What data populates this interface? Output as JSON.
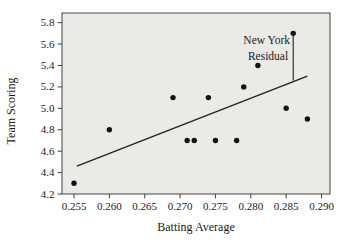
{
  "figure": {
    "background": "#ffffff"
  },
  "chart_data": {
    "type": "scatter",
    "title": "",
    "xlabel": "Batting Average",
    "ylabel": "Team Scoring",
    "xlim": [
      0.2533,
      0.2912
    ],
    "ylim": [
      4.2,
      5.89
    ],
    "xticks": [
      0.255,
      0.26,
      0.265,
      0.27,
      0.275,
      0.28,
      0.285,
      0.29
    ],
    "xtick_labels": [
      "0.255",
      "0.260",
      "0.265",
      "0.270",
      "0.275",
      "0.280",
      "0.285",
      "0.290"
    ],
    "yticks": [
      4.2,
      4.4,
      4.6,
      4.8,
      5.0,
      5.2,
      5.4,
      5.6,
      5.8
    ],
    "ytick_labels": [
      "4.2",
      "4.4",
      "4.6",
      "4.8",
      "5.0",
      "5.2",
      "5.4",
      "5.6",
      "5.8"
    ],
    "grid": false,
    "points": [
      [
        0.255,
        4.3
      ],
      [
        0.26,
        4.8
      ],
      [
        0.269,
        5.1
      ],
      [
        0.271,
        4.7
      ],
      [
        0.272,
        4.7
      ],
      [
        0.274,
        5.1
      ],
      [
        0.275,
        4.7
      ],
      [
        0.278,
        4.7
      ],
      [
        0.279,
        5.2
      ],
      [
        0.281,
        5.4
      ],
      [
        0.285,
        5.0
      ],
      [
        0.286,
        5.7,
        "New York"
      ],
      [
        0.288,
        4.9
      ]
    ],
    "trendline": {
      "x1": 0.2554,
      "y1": 4.46,
      "x2": 0.288,
      "y2": 5.3
    },
    "residual_line": {
      "x": 0.286,
      "y_top": 5.7,
      "y_bottom": 5.26
    },
    "annotation": {
      "lines": [
        "New York",
        "Residual"
      ]
    },
    "colors": {
      "point": "#111111",
      "line": "#222222",
      "frame": "#444444",
      "tick": "#444444",
      "text": "#1a1a1a",
      "plot_bg": "#ebeae7"
    }
  }
}
